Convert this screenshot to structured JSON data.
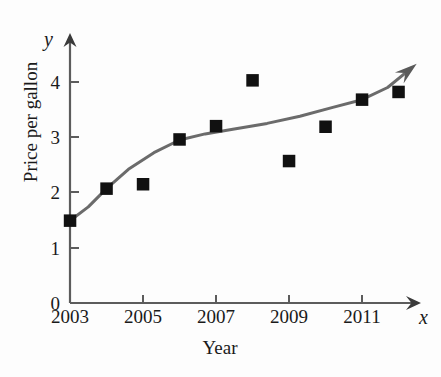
{
  "chart_data": {
    "type": "scatter",
    "title": "",
    "xlabel": "Year",
    "ylabel": "Price per gallon",
    "x_axis_variable": "x",
    "y_axis_variable": "y",
    "xlim": [
      2003,
      2012.6
    ],
    "ylim": [
      0,
      4.6
    ],
    "grid": false,
    "legend": null,
    "x_tick_labels": [
      "2003",
      "2005",
      "2007",
      "2009",
      "2011"
    ],
    "x_tick_values": [
      2003,
      2005,
      2007,
      2009,
      2011
    ],
    "x_minor_tick_values": [
      2004,
      2006,
      2008,
      2010,
      2012
    ],
    "y_tick_labels": [
      "0",
      "1",
      "2",
      "3",
      "4"
    ],
    "y_tick_values": [
      0,
      1,
      2,
      3,
      4
    ],
    "series": [
      {
        "name": "Price per gallon (data points)",
        "type": "scatter",
        "marker": "square",
        "color": "#111111",
        "x": [
          2003,
          2004,
          2005,
          2006,
          2007,
          2008,
          2009,
          2010,
          2011,
          2012
        ],
        "values": [
          1.49,
          2.07,
          2.15,
          2.96,
          3.2,
          4.03,
          2.57,
          3.19,
          3.68,
          3.82
        ]
      },
      {
        "name": "Regression curve",
        "type": "line",
        "color": "#6b6b6b",
        "arrow_end": true,
        "x": [
          2003,
          2003.5,
          2004,
          2004.6,
          2005.3,
          2006,
          2006.7,
          2007.5,
          2008.4,
          2009.3,
          2010.2,
          2011,
          2011.7,
          2012.35
        ],
        "values": [
          1.49,
          1.74,
          2.07,
          2.42,
          2.72,
          2.95,
          3.06,
          3.15,
          3.25,
          3.38,
          3.54,
          3.68,
          3.9,
          4.25
        ]
      }
    ],
    "axis_arrows": {
      "x_axis_arrow": true,
      "y_axis_arrow": true
    },
    "colors": {
      "curve": "#6b6b6b",
      "marker": "#111111",
      "axis": "#5c5c5c",
      "text": "#1a1a1a",
      "background": "#fdfdfd"
    }
  }
}
